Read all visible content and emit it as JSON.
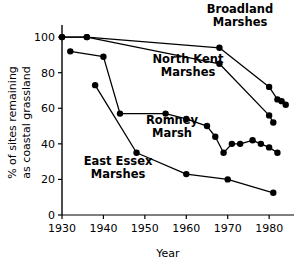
{
  "chart_data": {
    "type": "line",
    "title": "",
    "xlabel": "Year",
    "ylabel": "% of sites remaining as coastal grassland",
    "xlim": [
      1930,
      1986
    ],
    "ylim": [
      0,
      104
    ],
    "grid": false,
    "legend_position": "inline-annotations",
    "xticks": [
      1930,
      1940,
      1950,
      1960,
      1970,
      1980
    ],
    "xtick_labels": [
      "1930",
      "1940",
      "1950",
      "1960",
      "1970",
      "1980"
    ],
    "yticks": [
      0,
      20,
      40,
      60,
      80,
      100
    ],
    "ytick_labels": [
      "0",
      "20",
      "40",
      "60",
      "80",
      "100"
    ],
    "marker": "filled-circle",
    "line_color": "#000000",
    "marker_color": "#000000",
    "series": [
      {
        "name": "Broadland Marshes",
        "label_lines": [
          "Broadland",
          "Marshes"
        ],
        "x": [
          1930,
          1936,
          1968,
          1980,
          1982,
          1983,
          1984
        ],
        "values": [
          100,
          100,
          94,
          72,
          65,
          64,
          62
        ]
      },
      {
        "name": "North Kent Marshes",
        "label_lines": [
          "North Kent",
          "Marshes"
        ],
        "x": [
          1930,
          1936,
          1968,
          1980,
          1981
        ],
        "values": [
          100,
          100,
          85,
          56,
          52
        ]
      },
      {
        "name": "Romney Marsh",
        "label_lines": [
          "Romney",
          "Marsh"
        ],
        "x": [
          1932,
          1940,
          1944,
          1955,
          1960,
          1965,
          1967,
          1969,
          1971,
          1973,
          1976,
          1978,
          1980,
          1982
        ],
        "values": [
          92,
          89,
          57,
          57,
          54,
          50,
          44,
          35,
          40,
          40,
          42,
          40,
          38,
          35
        ]
      },
      {
        "name": "East Essex Marshes",
        "label_lines": [
          "East Essex",
          "Marshes"
        ],
        "x": [
          1938,
          1948,
          1960,
          1970,
          1981
        ],
        "values": [
          73,
          35,
          23,
          20,
          12.5
        ]
      }
    ],
    "annotations": [
      {
        "name": "broadland-label",
        "text_lines": [
          "Broadland",
          "Marshes"
        ],
        "x_px": 240,
        "y_px": 13,
        "anchor": "middle"
      },
      {
        "name": "north-kent-label",
        "text_lines": [
          "North Kent",
          "Marshes"
        ],
        "x_px": 188,
        "y_px": 63,
        "anchor": "middle"
      },
      {
        "name": "romney-label",
        "text_lines": [
          "Romney",
          "Marsh"
        ],
        "x_px": 172,
        "y_px": 124,
        "anchor": "middle"
      },
      {
        "name": "east-essex-label",
        "text_lines": [
          "East Essex",
          "Marshes"
        ],
        "x_px": 118,
        "y_px": 165,
        "anchor": "middle"
      }
    ]
  }
}
